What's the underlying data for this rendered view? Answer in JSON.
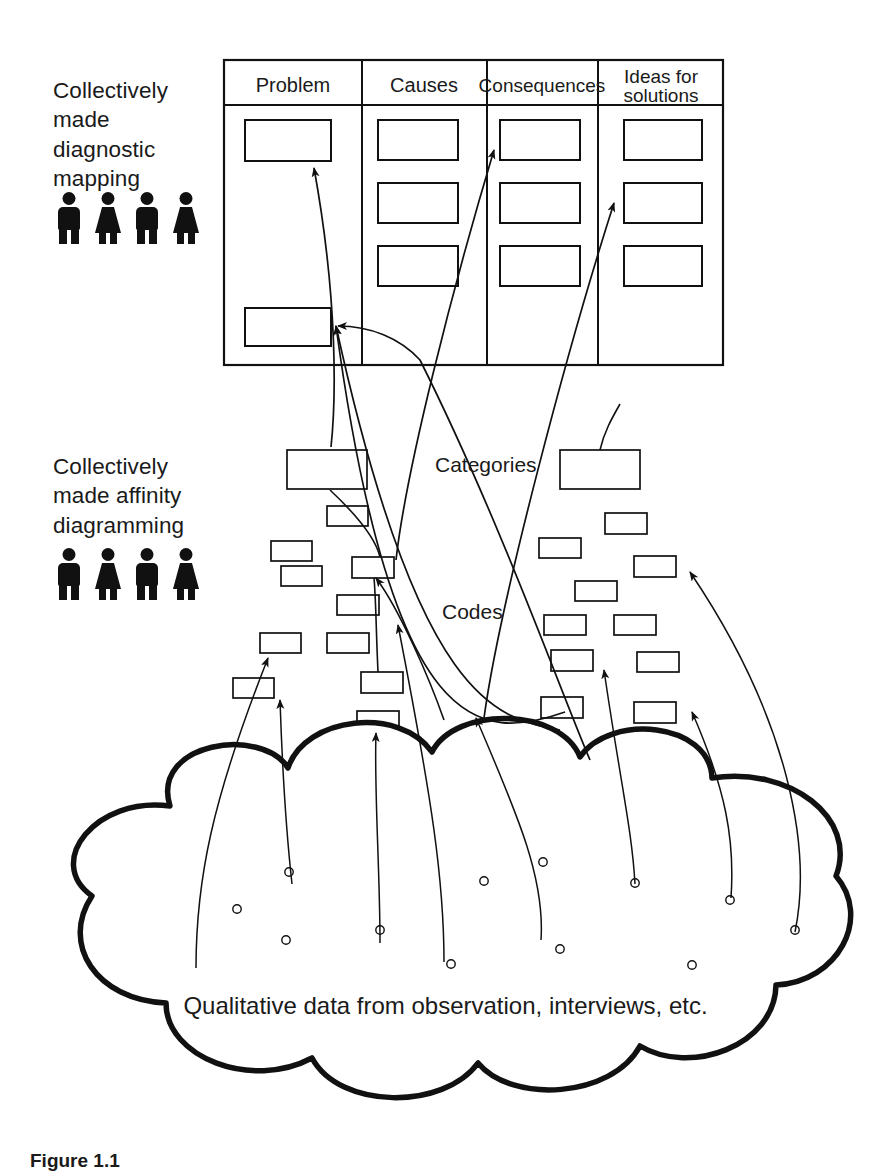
{
  "figure": {
    "caption": "Figure 1.1",
    "background_color": "#ffffff",
    "ink_color": "#111111"
  },
  "labels": {
    "diagnostic": "Collectively made diagnostic mapping",
    "affinity": "Collectively made affinity diagramming",
    "categories": "Categories",
    "codes": "Codes",
    "cloud": "Qualitative data from observation, interviews, etc."
  },
  "people": {
    "diagnostic_group": [
      "man",
      "woman",
      "man",
      "woman"
    ],
    "affinity_group": [
      "man",
      "woman",
      "man",
      "woman"
    ]
  },
  "matrix": {
    "columns": [
      {
        "header": "Problem",
        "cells": 2
      },
      {
        "header": "Causes",
        "cells": 3
      },
      {
        "header": "Consequences",
        "cells": 3
      },
      {
        "header": "Ideas for\nsolutions",
        "cells": 3
      }
    ],
    "bounds": {
      "x": 224,
      "y": 60,
      "width": 499,
      "height": 305
    },
    "header_height": 45,
    "column_dividers_x": [
      362,
      487,
      598
    ]
  },
  "chart_data": {
    "type": "diagram",
    "layers": [
      {
        "name": "qualitative data",
        "label": "Qualitative data from observation, interviews, etc.",
        "shape": "cloud",
        "item_count": 11
      },
      {
        "name": "codes",
        "label": "Codes",
        "shape": "small-box",
        "item_count": 20
      },
      {
        "name": "categories",
        "label": "Categories",
        "shape": "large-box",
        "item_count": 2
      },
      {
        "name": "diagnostic matrix",
        "label": "Problem / Causes / Consequences / Ideas for solutions",
        "shape": "table",
        "item_count": 11
      }
    ]
  },
  "matrix_boxes": [
    {
      "x": 245,
      "y": 120,
      "w": 86,
      "h": 41
    },
    {
      "x": 245,
      "y": 308,
      "w": 86,
      "h": 38
    },
    {
      "x": 378,
      "y": 120,
      "w": 80,
      "h": 40
    },
    {
      "x": 378,
      "y": 183,
      "w": 80,
      "h": 40
    },
    {
      "x": 378,
      "y": 246,
      "w": 80,
      "h": 40
    },
    {
      "x": 500,
      "y": 120,
      "w": 80,
      "h": 40
    },
    {
      "x": 500,
      "y": 183,
      "w": 80,
      "h": 40
    },
    {
      "x": 500,
      "y": 246,
      "w": 80,
      "h": 40
    },
    {
      "x": 624,
      "y": 120,
      "w": 78,
      "h": 40
    },
    {
      "x": 624,
      "y": 183,
      "w": 78,
      "h": 40
    },
    {
      "x": 624,
      "y": 246,
      "w": 78,
      "h": 40
    }
  ],
  "category_boxes": [
    {
      "x": 287,
      "y": 450,
      "w": 80,
      "h": 39
    },
    {
      "x": 560,
      "y": 450,
      "w": 80,
      "h": 39
    }
  ],
  "code_boxes": [
    {
      "x": 327,
      "y": 506,
      "w": 41,
      "h": 20
    },
    {
      "x": 271,
      "y": 541,
      "w": 41,
      "h": 20
    },
    {
      "x": 281,
      "y": 566,
      "w": 41,
      "h": 20
    },
    {
      "x": 352,
      "y": 557,
      "w": 42,
      "h": 21
    },
    {
      "x": 337,
      "y": 595,
      "w": 42,
      "h": 20
    },
    {
      "x": 260,
      "y": 633,
      "w": 41,
      "h": 20
    },
    {
      "x": 327,
      "y": 633,
      "w": 42,
      "h": 20
    },
    {
      "x": 233,
      "y": 678,
      "w": 41,
      "h": 20
    },
    {
      "x": 361,
      "y": 672,
      "w": 42,
      "h": 21
    },
    {
      "x": 357,
      "y": 711,
      "w": 42,
      "h": 21
    },
    {
      "x": 605,
      "y": 513,
      "w": 42,
      "h": 21
    },
    {
      "x": 539,
      "y": 538,
      "w": 42,
      "h": 20
    },
    {
      "x": 634,
      "y": 556,
      "w": 42,
      "h": 21
    },
    {
      "x": 575,
      "y": 581,
      "w": 42,
      "h": 20
    },
    {
      "x": 544,
      "y": 615,
      "w": 42,
      "h": 20
    },
    {
      "x": 614,
      "y": 615,
      "w": 42,
      "h": 20
    },
    {
      "x": 551,
      "y": 650,
      "w": 42,
      "h": 21
    },
    {
      "x": 637,
      "y": 652,
      "w": 42,
      "h": 20
    },
    {
      "x": 541,
      "y": 697,
      "w": 42,
      "h": 21
    },
    {
      "x": 634,
      "y": 702,
      "w": 42,
      "h": 21
    }
  ],
  "data_points": [
    {
      "x": 237,
      "y": 909
    },
    {
      "x": 286,
      "y": 940
    },
    {
      "x": 289,
      "y": 872
    },
    {
      "x": 380,
      "y": 930
    },
    {
      "x": 451,
      "y": 964
    },
    {
      "x": 484,
      "y": 881
    },
    {
      "x": 543,
      "y": 862
    },
    {
      "x": 560,
      "y": 949
    },
    {
      "x": 635,
      "y": 883
    },
    {
      "x": 692,
      "y": 965
    },
    {
      "x": 730,
      "y": 900
    },
    {
      "x": 795,
      "y": 930
    }
  ]
}
